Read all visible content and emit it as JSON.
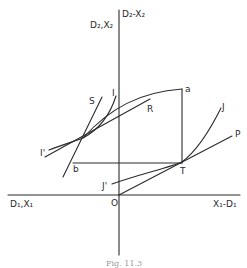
{
  "figure": {
    "caption": "Fig. 11.3",
    "axes": {
      "y_axis_top_label": "D₂-X₂",
      "y_axis_left_label": "D₂,X₂",
      "x_axis_left_label": "D₁,X₁",
      "x_axis_right_label": "X₁-D₁",
      "origin_label": "O"
    },
    "points": {
      "a": "a",
      "b": "b",
      "T": "T"
    },
    "curves": {
      "S": "S",
      "I": "I",
      "I_prime": "I'",
      "R": "R",
      "J": "J",
      "J_prime": "J'",
      "P": "P"
    }
  }
}
